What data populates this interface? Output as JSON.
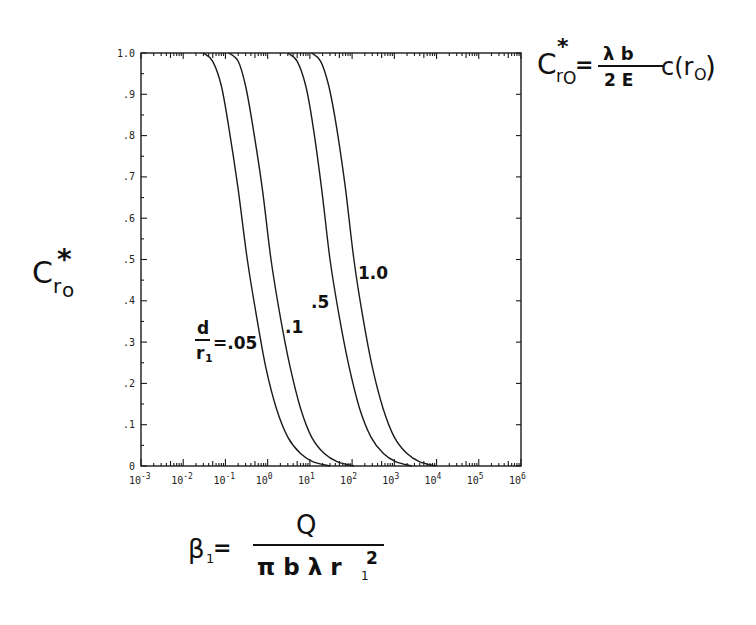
{
  "chart_data": {
    "type": "line",
    "title": "",
    "xscale": "log",
    "xlabel": "β1 = Q / (π b λ r1²)",
    "ylabel": "C*r0",
    "formula_annotation": "C*r0 = (λ b / 2 E) c(r0)",
    "xlim": [
      0.001,
      1000000
    ],
    "ylim": [
      0,
      1.0
    ],
    "grid": false,
    "legend_position": "inline labels on curves",
    "x_ticks": [
      "10^-3",
      "10^-2",
      "10^-1",
      "10^0",
      "10^1",
      "10^2",
      "10^3",
      "10^4",
      "10^5",
      "10^6"
    ],
    "y_ticks": [
      "0",
      ".1",
      ".2",
      ".3",
      ".4",
      ".5",
      ".6",
      ".7",
      ".8",
      ".9",
      "1.0"
    ],
    "series": [
      {
        "name": "d/r1 = .05",
        "points": [
          [
            0.03,
            1.0
          ],
          [
            0.05,
            0.98
          ],
          [
            0.08,
            0.92
          ],
          [
            0.12,
            0.82
          ],
          [
            0.2,
            0.67
          ],
          [
            0.33,
            0.5
          ],
          [
            0.55,
            0.36
          ],
          [
            0.9,
            0.24
          ],
          [
            1.6,
            0.14
          ],
          [
            3,
            0.07
          ],
          [
            6,
            0.03
          ],
          [
            12,
            0.01
          ],
          [
            30,
            0.0
          ]
        ]
      },
      {
        "name": "d/r1 = .1",
        "points": [
          [
            0.12,
            1.0
          ],
          [
            0.2,
            0.98
          ],
          [
            0.3,
            0.92
          ],
          [
            0.45,
            0.82
          ],
          [
            0.75,
            0.67
          ],
          [
            1.2,
            0.5
          ],
          [
            2.0,
            0.36
          ],
          [
            3.4,
            0.24
          ],
          [
            6,
            0.14
          ],
          [
            11,
            0.07
          ],
          [
            22,
            0.03
          ],
          [
            45,
            0.01
          ],
          [
            110,
            0.0
          ]
        ]
      },
      {
        "name": "d/r1 = .5",
        "points": [
          [
            3,
            1.0
          ],
          [
            5,
            0.98
          ],
          [
            8,
            0.92
          ],
          [
            12,
            0.82
          ],
          [
            19,
            0.67
          ],
          [
            30,
            0.5
          ],
          [
            50,
            0.36
          ],
          [
            85,
            0.24
          ],
          [
            150,
            0.14
          ],
          [
            280,
            0.07
          ],
          [
            550,
            0.03
          ],
          [
            1100,
            0.01
          ],
          [
            2600,
            0.0
          ]
        ]
      },
      {
        "name": "d/r1 = 1.0",
        "points": [
          [
            11,
            1.0
          ],
          [
            18,
            0.98
          ],
          [
            28,
            0.92
          ],
          [
            43,
            0.82
          ],
          [
            70,
            0.67
          ],
          [
            110,
            0.5
          ],
          [
            180,
            0.36
          ],
          [
            300,
            0.24
          ],
          [
            540,
            0.14
          ],
          [
            1000,
            0.07
          ],
          [
            2000,
            0.03
          ],
          [
            4000,
            0.01
          ],
          [
            9500,
            0.0
          ]
        ]
      }
    ]
  },
  "labels": {
    "ylabel_main": "C",
    "ylabel_star": "*",
    "ylabel_sub": "r",
    "ylabel_sub2": "o",
    "curve_label_05_num": "d",
    "curve_label_05_den": "r",
    "curve_label_05_den_sub": "1",
    "curve_label_05_value": "=.05",
    "curve_label_1": ".1",
    "curve_label_5": ".5",
    "curve_label_10": "1.0",
    "formula_lhs": "C",
    "formula_star": "*",
    "formula_sub": "r",
    "formula_sub2": "O",
    "formula_eq": "=",
    "formula_num": "λ b",
    "formula_den": "2 E",
    "formula_tail": "c(r",
    "formula_tail_sub": "O",
    "formula_tail_close": ")",
    "xlabel_lhs": "β",
    "xlabel_lhs_sub": "1",
    "xlabel_eq": "=",
    "xlabel_num": "Q",
    "xlabel_den": "π b λ r",
    "xlabel_den_sub": "1",
    "xlabel_den_sup": "2"
  }
}
